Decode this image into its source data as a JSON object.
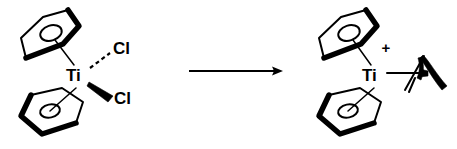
{
  "figure": {
    "kind": "chemical-reaction-scheme",
    "background_color": "#ffffff",
    "ink_color": "#000000",
    "width": 457,
    "height": 149
  },
  "reactant": {
    "name": "titanocene-dichloride",
    "metal_label": "Ti",
    "ligands": [
      {
        "name": "cyclopentadienyl-top",
        "label": "",
        "bond_style": "plain"
      },
      {
        "name": "cyclopentadienyl-bottom",
        "label": "",
        "bond_style": "plain"
      },
      {
        "name": "chloride-upper",
        "label": "Cl",
        "bond_style": "hashed"
      },
      {
        "name": "chloride-lower",
        "label": "Cl",
        "bond_style": "wedge"
      }
    ]
  },
  "arrow": {
    "name": "reaction-arrow",
    "direction": "right",
    "label_above": "",
    "label_below": ""
  },
  "product": {
    "name": "titanocene-alkene-cation",
    "metal_label": "Ti",
    "charge_label": "+",
    "ligands": [
      {
        "name": "cyclopentadienyl-top",
        "label": "",
        "bond_style": "plain"
      },
      {
        "name": "cyclopentadienyl-bottom",
        "label": "",
        "bond_style": "plain"
      },
      {
        "name": "alkene-ligand",
        "label": "",
        "bond_style": "plain"
      }
    ]
  }
}
